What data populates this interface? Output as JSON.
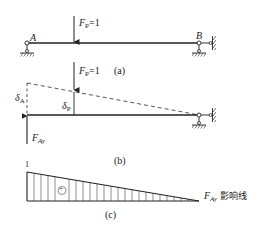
{
  "diagram": {
    "panel_a": {
      "caption": "(a)",
      "force_symbol": "F",
      "force_sub": "P",
      "force_value": "=1",
      "support_left_label": "A",
      "support_right_label": "B"
    },
    "panel_b": {
      "caption": "(b)",
      "force_symbol": "F",
      "force_sub": "P",
      "force_value": "=1",
      "delta_a_symbol": "δ",
      "delta_a_sub": "A",
      "delta_p_symbol": "δ",
      "delta_p_sub": "P",
      "reaction_symbol": "F",
      "reaction_sub": "Ay"
    },
    "panel_c": {
      "caption": "(c)",
      "ordinate_label": "1",
      "sign": "+",
      "line_symbol": "F",
      "line_sub": "Ay",
      "line_text": "影响线"
    }
  },
  "colors": {
    "line": "#222222",
    "hatch": "#444444",
    "background": "#ffffff"
  }
}
